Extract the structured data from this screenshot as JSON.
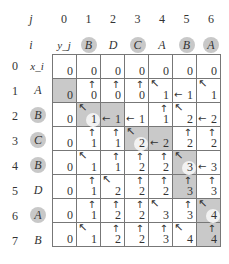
{
  "header": {
    "j_label": "j",
    "i_label": "i",
    "y_label": "y_j",
    "x_label": "x_i",
    "j_indices": [
      "0",
      "1",
      "2",
      "3",
      "4",
      "5",
      "6"
    ],
    "i_indices": [
      "0",
      "1",
      "2",
      "3",
      "4",
      "5",
      "6",
      "7"
    ]
  },
  "y_sequence": [
    {
      "char": "B",
      "highlight": true
    },
    {
      "char": "D",
      "highlight": false
    },
    {
      "char": "C",
      "highlight": true
    },
    {
      "char": "A",
      "highlight": false
    },
    {
      "char": "B",
      "highlight": true
    },
    {
      "char": "A",
      "highlight": true
    }
  ],
  "x_sequence": [
    {
      "char": "A",
      "highlight": false
    },
    {
      "char": "B",
      "highlight": true
    },
    {
      "char": "C",
      "highlight": true
    },
    {
      "char": "B",
      "highlight": true
    },
    {
      "char": "D",
      "highlight": false
    },
    {
      "char": "A",
      "highlight": true
    },
    {
      "char": "B",
      "highlight": false
    }
  ],
  "table": {
    "rows": [
      [
        {
          "v": "0"
        },
        {
          "v": "0"
        },
        {
          "v": "0"
        },
        {
          "v": "0"
        },
        {
          "v": "0"
        },
        {
          "v": "0"
        },
        {
          "v": "0"
        }
      ],
      [
        {
          "v": "0",
          "s": 1
        },
        {
          "v": "0",
          "a": "up"
        },
        {
          "v": "0",
          "a": "up"
        },
        {
          "v": "0",
          "a": "up"
        },
        {
          "v": "1",
          "a": "diag"
        },
        {
          "v": "1",
          "a": "left"
        },
        {
          "v": "1",
          "a": "diag"
        }
      ],
      [
        {
          "v": "0"
        },
        {
          "v": "1",
          "a": "diag",
          "s": 1,
          "c": 1
        },
        {
          "v": "1",
          "a": "left",
          "s": 1
        },
        {
          "v": "1",
          "a": "left"
        },
        {
          "v": "1",
          "a": "up"
        },
        {
          "v": "2",
          "a": "diag"
        },
        {
          "v": "2",
          "a": "left"
        }
      ],
      [
        {
          "v": "0"
        },
        {
          "v": "1",
          "a": "up"
        },
        {
          "v": "1",
          "a": "up"
        },
        {
          "v": "2",
          "a": "diag",
          "s": 1,
          "c": 1
        },
        {
          "v": "2",
          "a": "left",
          "s": 1
        },
        {
          "v": "2",
          "a": "up"
        },
        {
          "v": "2",
          "a": "up"
        }
      ],
      [
        {
          "v": "0"
        },
        {
          "v": "1",
          "a": "diag"
        },
        {
          "v": "1",
          "a": "up"
        },
        {
          "v": "2",
          "a": "up"
        },
        {
          "v": "2",
          "a": "up"
        },
        {
          "v": "3",
          "a": "diag",
          "s": 1,
          "c": 1
        },
        {
          "v": "3",
          "a": "left"
        }
      ],
      [
        {
          "v": "0"
        },
        {
          "v": "1",
          "a": "up"
        },
        {
          "v": "2",
          "a": "diag"
        },
        {
          "v": "2",
          "a": "up"
        },
        {
          "v": "2",
          "a": "up"
        },
        {
          "v": "3",
          "a": "up",
          "s": 1
        },
        {
          "v": "3",
          "a": "up"
        }
      ],
      [
        {
          "v": "0"
        },
        {
          "v": "1",
          "a": "up"
        },
        {
          "v": "2",
          "a": "up"
        },
        {
          "v": "2",
          "a": "up"
        },
        {
          "v": "3",
          "a": "diag"
        },
        {
          "v": "3",
          "a": "up"
        },
        {
          "v": "4",
          "a": "diag",
          "s": 1,
          "c": 1
        }
      ],
      [
        {
          "v": "0"
        },
        {
          "v": "1",
          "a": "diag"
        },
        {
          "v": "2",
          "a": "up"
        },
        {
          "v": "2",
          "a": "up"
        },
        {
          "v": "3",
          "a": "up"
        },
        {
          "v": "4",
          "a": "diag"
        },
        {
          "v": "4",
          "a": "up",
          "s": 1
        }
      ]
    ]
  },
  "arrow_glyphs": {
    "up": "↑",
    "left": "←",
    "diag": "↖"
  },
  "colors": {
    "shade": "#c9c9c9",
    "circle": "#c8c8c8",
    "grid": "#777777"
  }
}
